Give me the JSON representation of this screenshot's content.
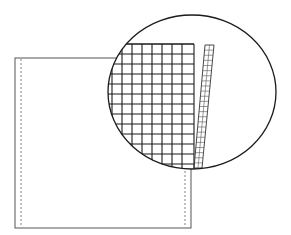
{
  "figure": {
    "background": "#ffffff",
    "stroke": "#1a1a1a",
    "light_stroke": "#555555",
    "sheet": {
      "x": 15,
      "y": 58,
      "width": 176,
      "height": 170
    },
    "fold_lines": [
      21,
      185
    ],
    "magnifier": {
      "cx": 192,
      "cy": 92,
      "rx": 84,
      "ry": 77
    },
    "mesh": {
      "x0": 110,
      "x1": 194,
      "y0": 44,
      "y1": 168,
      "cols": [
        112,
        122,
        132,
        142,
        152,
        162,
        172,
        182,
        194
      ],
      "rows": [
        44,
        54,
        64,
        74,
        84,
        94,
        104,
        114,
        124,
        134,
        144,
        154,
        164
      ]
    },
    "strip": {
      "top_left": [
        205,
        45
      ],
      "top_right": [
        214,
        45
      ],
      "bottom_left": [
        194,
        168
      ],
      "bottom_right": [
        202,
        168
      ],
      "rungs": 24
    }
  }
}
